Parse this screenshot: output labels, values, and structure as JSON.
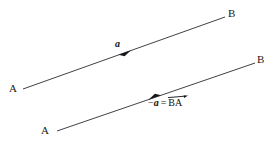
{
  "figure": {
    "background_color": "#ffffff",
    "stroke_color": "#2b2b33",
    "text_color": "#1a1a1a",
    "width": 279,
    "height": 145
  },
  "vectors": [
    {
      "id": "vector-a",
      "label": "a",
      "label_style": "bold-italic",
      "from_point": "A",
      "to_point": "B",
      "direction": "A-to-B",
      "start": {
        "x": 23,
        "y": 89
      },
      "end": {
        "x": 225,
        "y": 17
      },
      "arrowhead": {
        "x": 124,
        "y": 53,
        "points": "up-right"
      },
      "label_pos": {
        "x": 115,
        "y": 39
      }
    },
    {
      "id": "vector-minus-a",
      "label_minus": "−",
      "label_a": "a",
      "label_equals": "=",
      "label_ba": "BA",
      "label_style": "bold-italic",
      "from_point": "B",
      "to_point": "A",
      "direction": "B-to-A",
      "start": {
        "x": 255,
        "y": 63
      },
      "end": {
        "x": 57,
        "y": 131
      },
      "arrowhead": {
        "x": 155,
        "y": 97,
        "points": "down-left"
      },
      "label_pos": {
        "x": 148,
        "y": 97
      }
    }
  ],
  "point_labels": [
    {
      "id": "label-b-top",
      "text": "B",
      "x": 228,
      "y": 8
    },
    {
      "id": "label-a-left",
      "text": "A",
      "x": 9,
      "y": 83
    },
    {
      "id": "label-b-lower",
      "text": "B",
      "x": 257,
      "y": 54
    },
    {
      "id": "label-a-bottom",
      "text": "A",
      "x": 41,
      "y": 125
    }
  ]
}
